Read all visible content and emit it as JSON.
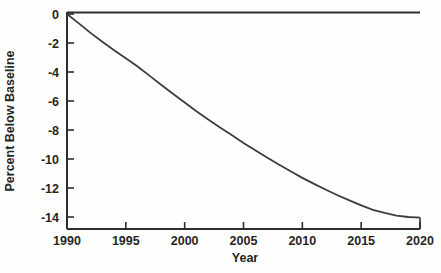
{
  "figure": {
    "background": "#fefefd",
    "axis_color": "#2e2e2e",
    "line_color": "#3d3d3d",
    "text_color": "#262626"
  },
  "chart_data": {
    "type": "line",
    "title": "",
    "xlabel": "Year",
    "ylabel": "Percent Below Baseline",
    "xlim": [
      1990,
      2020
    ],
    "ylim": [
      -14.8,
      0
    ],
    "x_ticks": [
      1990,
      1995,
      2000,
      2005,
      2010,
      2015,
      2020
    ],
    "y_ticks": [
      0,
      -2,
      -4,
      -6,
      -8,
      -10,
      -12,
      -14
    ],
    "grid": false,
    "legend": false,
    "baseline_value": 0,
    "series": [
      {
        "name": "percent-below-baseline",
        "x": [
          1990,
          1991,
          1992,
          1993,
          1994,
          1995,
          1996,
          1997,
          1998,
          1999,
          2000,
          2001,
          2002,
          2003,
          2004,
          2005,
          2006,
          2007,
          2008,
          2009,
          2010,
          2011,
          2012,
          2013,
          2014,
          2015,
          2016,
          2017,
          2018,
          2019,
          2020
        ],
        "y": [
          0,
          -0.65,
          -1.3,
          -1.92,
          -2.5,
          -3.05,
          -3.62,
          -4.25,
          -4.88,
          -5.5,
          -6.1,
          -6.7,
          -7.28,
          -7.82,
          -8.35,
          -8.9,
          -9.4,
          -9.9,
          -10.38,
          -10.85,
          -11.3,
          -11.72,
          -12.12,
          -12.5,
          -12.85,
          -13.2,
          -13.5,
          -13.72,
          -13.9,
          -14.0,
          -14.05
        ]
      }
    ]
  }
}
